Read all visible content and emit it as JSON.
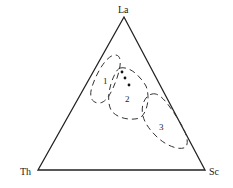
{
  "diagram": {
    "type": "ternary",
    "vertices": {
      "top": "La",
      "left": "Th",
      "right": "Sc"
    },
    "fields": [
      {
        "id": "1",
        "label": "1"
      },
      {
        "id": "2",
        "label": "2"
      },
      {
        "id": "3",
        "label": "3"
      }
    ],
    "sample_points_count": 3,
    "colors": {
      "line": "#222222",
      "background": "#ffffff"
    }
  }
}
